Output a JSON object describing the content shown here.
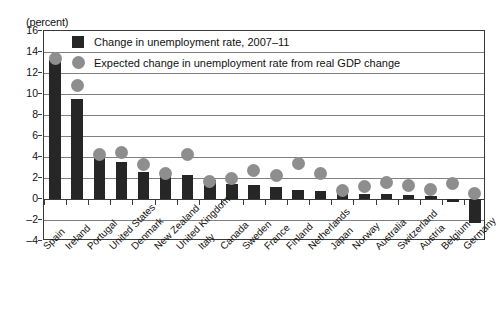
{
  "axis": {
    "unit_label": "(percent)",
    "yticks": [
      16,
      14,
      12,
      10,
      8,
      6,
      4,
      2,
      0,
      -2,
      -4
    ]
  },
  "legend": {
    "items": [
      {
        "marker": "square-marker",
        "label": "Change in unemployment rate, 2007–11",
        "color": "#262626"
      },
      {
        "marker": "circle-marker",
        "label": "Expected change in unemployment rate from real GDP change",
        "color": "#8e8e8e"
      }
    ]
  },
  "chart_data": {
    "type": "bar",
    "title": "",
    "subtitle": "",
    "xlabel": "",
    "ylabel": "(percent)",
    "ylim": [
      -4,
      16
    ],
    "ytick_step": 2,
    "grid": true,
    "legend_position": "top-center",
    "categories": [
      "Spain",
      "Ireland",
      "Portugal",
      "United States",
      "Denmark",
      "New Zealand",
      "United Kingdom",
      "Italy",
      "Canada",
      "Sweden",
      "France",
      "Finland",
      "Netherlands",
      "Japan",
      "Norway",
      "Australia",
      "Switzerland",
      "Austria",
      "Belgium",
      "Germany"
    ],
    "series": [
      {
        "name": "Change in unemployment rate, 2007–11",
        "type": "bar",
        "color": "#262626",
        "values": [
          13.2,
          9.5,
          3.9,
          3.5,
          2.6,
          2.5,
          2.3,
          1.8,
          1.4,
          1.3,
          1.1,
          0.9,
          0.8,
          0.6,
          0.5,
          0.5,
          0.4,
          0.3,
          -0.3,
          -2.3
        ]
      },
      {
        "name": "Expected change in unemployment rate from real GDP change",
        "type": "scatter",
        "color": "#8e8e8e",
        "values": [
          13.4,
          10.8,
          4.2,
          4.4,
          3.3,
          2.4,
          4.2,
          1.7,
          2.0,
          2.7,
          2.2,
          3.4,
          2.4,
          0.8,
          1.2,
          1.6,
          1.3,
          0.9,
          1.5,
          0.5
        ]
      }
    ]
  }
}
